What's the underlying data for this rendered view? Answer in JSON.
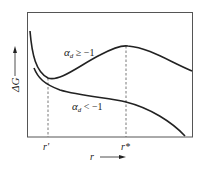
{
  "diagram": {
    "y_axis_label": "ΔG",
    "x_axis_label": "r",
    "curves": [
      {
        "name": "upper",
        "label_main": "α",
        "label_sub": "d",
        "label_rel": " ≥ −1"
      },
      {
        "name": "lower",
        "label_main": "α",
        "label_sub": "d",
        "label_rel": " < −1"
      }
    ],
    "ticks": [
      {
        "label": "r'",
        "x_pos": "r_prime"
      },
      {
        "label": "r*",
        "x_pos": "r_star"
      }
    ],
    "tick_r_prime": "r'",
    "tick_r_star": "r*",
    "colors": {
      "line": "#222222",
      "frame": "#555555",
      "dashed": "#555555"
    }
  }
}
